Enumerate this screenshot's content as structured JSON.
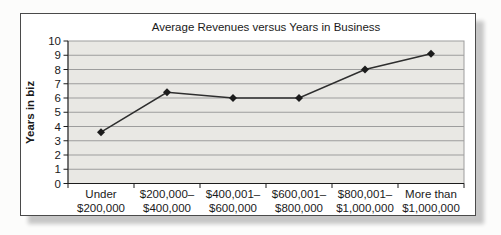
{
  "chart_data": {
    "type": "line",
    "title": "Average Revenues versus Years in Business",
    "ylabel": "Years in biz",
    "xlabel": "",
    "categories": [
      "Under\n$200,000",
      "$200,000–\n$400,000",
      "$400,001–\n$600,000",
      "$600,001–\n$800,000",
      "$800,001–\n$1,000,000",
      "More than\n$1,000,000"
    ],
    "values": [
      3.6,
      6.4,
      6.0,
      6.0,
      8.0,
      9.1
    ],
    "ylim": [
      0,
      10
    ],
    "ytick_step": 1,
    "grid": "horizontal",
    "legend": "none",
    "marker": "diamond",
    "colors": {
      "line": "#2e2e2e",
      "marker": "#1c1c1c",
      "plot_bg": "#e9e8e4",
      "gridline": "#9d9d9d",
      "axis": "#1c1c1c",
      "text": "#1a1a1a",
      "box_border": "#4a4a4a",
      "shadow": "#c6c6c6"
    }
  }
}
